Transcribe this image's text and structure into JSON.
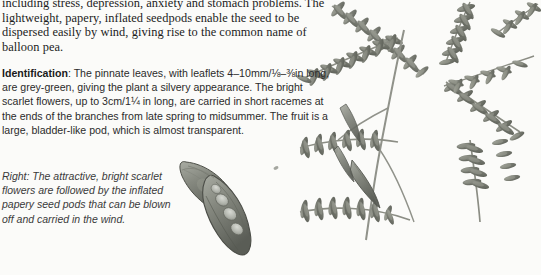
{
  "page": {
    "background_color": "#fbfbf9",
    "text_color": "#1c1c1c",
    "width": 541,
    "height": 275
  },
  "body_paragraph": {
    "text": "including stress, depression, anxiety and stomach problems. The lightweight, papery, inflated seedpods enable the seed to be dispersed easily by wind, giving rise to the common name of balloon pea."
  },
  "identification": {
    "label": "Identification",
    "separator": ": ",
    "text": "The pinnate leaves, with leaflets 4–10mm/⅛–⅜in long, are grey-green, giving the plant a silvery appearance. The bright scarlet flowers, up to 3cm/1¼ in long, are carried in short racemes at the ends of the branches from late spring to midsummer. The fruit is a large, bladder-like pod, which is almost transparent.",
    "leaflet_size_metric": "4–10mm",
    "leaflet_size_imperial": "⅛–⅜in",
    "flower_size_metric": "3cm",
    "flower_size_imperial": "1¼ in"
  },
  "caption": {
    "label": "Right",
    "separator": ": ",
    "text": "The attractive, bright scarlet flowers are followed by the inflated papery seed pods that can be blown off and carried in the wind."
  },
  "illustration": {
    "name": "balloon-pea-botanical-illustration",
    "subjects": [
      "pinnate-leaf-sprays",
      "inflated-seedpods",
      "branching-stems"
    ],
    "leaflet_color": "#84877f",
    "leaflet_color_dark": "#5f625b",
    "stem_color": "#8b8d84",
    "pod_color": "#7c7e76",
    "pod_outline_color": "#4e5049"
  }
}
